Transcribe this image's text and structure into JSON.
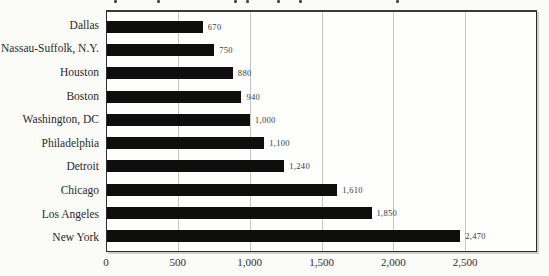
{
  "chart_data": {
    "type": "bar",
    "orientation": "horizontal",
    "title": "",
    "title_clipped_at_top": true,
    "categories": [
      "Dallas",
      "Nassau-Suffolk, N.Y.",
      "Houston",
      "Boston",
      "Washington, DC",
      "Philadelphia",
      "Detroit",
      "Chicago",
      "Los Angeles",
      "New York"
    ],
    "values": [
      670,
      750,
      880,
      940,
      1000,
      1100,
      1240,
      1610,
      1850,
      2470
    ],
    "value_labels": [
      "670",
      "750",
      "880",
      "940",
      "1,000",
      "1,100",
      "1,240",
      "1,610",
      "1,850",
      "2,470"
    ],
    "xlabel": "",
    "ylabel": "",
    "x_axis": {
      "min": 0,
      "max": 3000,
      "ticks": [
        0,
        500,
        1000,
        1500,
        2000,
        2500
      ],
      "tick_labels": [
        "0",
        "500",
        "1,000",
        "1,500",
        "2,000",
        "2,500"
      ]
    },
    "grid": true,
    "legend": false,
    "colors": {
      "bar": "#0e0e0e",
      "gridline": "#c6c6c3",
      "frame": "#2a2a2a",
      "background": "#fbfbf8"
    }
  },
  "decor": {
    "title_fragment_positions": [
      114,
      157,
      234,
      246,
      277,
      299,
      396
    ]
  }
}
